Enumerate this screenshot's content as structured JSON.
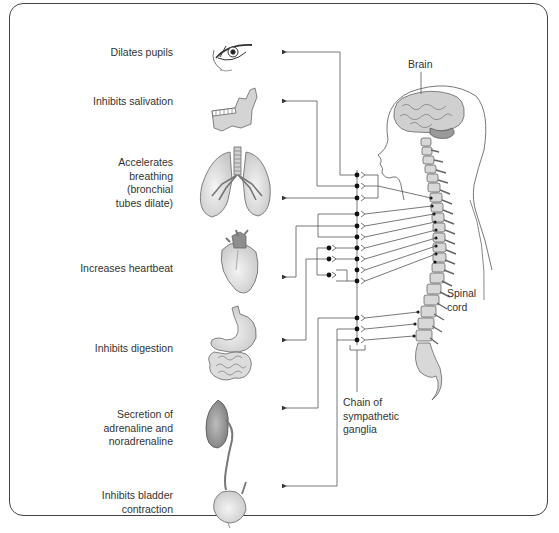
{
  "diagram": {
    "effects": [
      {
        "id": "pupils",
        "lines": [
          "Dilates pupils"
        ],
        "organ": "eye"
      },
      {
        "id": "salivation",
        "lines": [
          "Inhibits salivation"
        ],
        "organ": "jaw-salivary"
      },
      {
        "id": "breathing",
        "lines": [
          "Accelerates",
          "breathing",
          "(bronchial",
          "tubes dilate)"
        ],
        "organ": "lungs"
      },
      {
        "id": "heartbeat",
        "lines": [
          "Increases heartbeat"
        ],
        "organ": "heart"
      },
      {
        "id": "digestion",
        "lines": [
          "Inhibits digestion"
        ],
        "organ": "stomach-intestines"
      },
      {
        "id": "adrenaline",
        "lines": [
          "Secretion of",
          "adrenaline and",
          "noradrenaline"
        ],
        "organ": "adrenal-kidney"
      },
      {
        "id": "bladder",
        "lines": [
          "Inhibits bladder",
          "contraction"
        ],
        "organ": "bladder"
      }
    ],
    "labels": {
      "brain": "Brain",
      "spinal_cord": [
        "Spinal",
        "cord"
      ],
      "ganglia": [
        "Chain of",
        "sympathetic",
        "ganglia"
      ]
    },
    "colors": {
      "line": "#555555",
      "organ_fill": "#dcdcdc",
      "organ_dark": "#8a8a8a",
      "text": "#333333"
    }
  }
}
